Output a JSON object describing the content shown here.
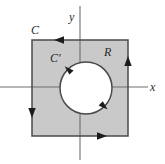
{
  "figure": {
    "width": 165,
    "height": 164,
    "background_color": "#ffffff"
  },
  "colors": {
    "region_fill": "#c9c9c9",
    "region_stroke": "#4a4a4a",
    "hole_fill": "#ffffff",
    "hole_stroke": "#4a4a4a",
    "axis_stroke": "#6e6e6e",
    "arrow_fill": "#1c1c1c",
    "label_color": "#2b2b2b"
  },
  "labels": {
    "outer_curve": "C",
    "inner_curve": "C′",
    "region": "R",
    "y_axis": "y",
    "x_axis": "x"
  },
  "chart_data": {
    "type": "diagram",
    "title": "",
    "xlabel": "x",
    "ylabel": "y",
    "grid": false,
    "legend_position": "none",
    "axes": {
      "x_axis_y_px": 87,
      "y_axis_x_px": 80,
      "x_axis_extent_px": [
        0,
        148
      ],
      "y_axis_extent_px": [
        6,
        160
      ]
    },
    "shapes": [
      {
        "name": "outer-boundary-square",
        "label": "C",
        "kind": "rectangle",
        "orientation": "counterclockwise",
        "fill": "#c9c9c9",
        "stroke": "#4a4a4a",
        "bounds_px": {
          "x": 32,
          "y": 40,
          "width": 96,
          "height": 96
        },
        "arrow_markers": [
          {
            "edge": "top",
            "direction": "left",
            "position_px": [
              61,
              40
            ]
          },
          {
            "edge": "left",
            "direction": "down",
            "position_px": [
              32,
              110
            ]
          },
          {
            "edge": "bottom",
            "direction": "right",
            "position_px": [
              99,
              136
            ]
          },
          {
            "edge": "right",
            "direction": "up",
            "position_px": [
              128,
              64
            ]
          }
        ]
      },
      {
        "name": "inner-boundary-circle",
        "label": "C′",
        "kind": "circle",
        "orientation": "clockwise",
        "fill": "#ffffff",
        "stroke": "#4a4a4a",
        "center_px": [
          86,
          88
        ],
        "radius_px": 26,
        "arrow_markers": [
          {
            "angle_deg": 135,
            "direction": "up-left",
            "position_px": [
              67.6,
              69.6
            ]
          },
          {
            "angle_deg": 315,
            "direction": "down-right",
            "position_px": [
              104.4,
              106.4
            ]
          }
        ]
      }
    ],
    "annotations": [
      {
        "text": "C",
        "position_px": [
          35,
          30
        ],
        "describes": "outer square boundary curve"
      },
      {
        "text": "C′",
        "position_px": [
          55,
          58
        ],
        "describes": "inner circular boundary curve"
      },
      {
        "text": "R",
        "position_px": [
          108,
          52
        ],
        "describes": "shaded annular region"
      },
      {
        "text": "y",
        "position_px": [
          72,
          17
        ],
        "describes": "vertical axis"
      },
      {
        "text": "x",
        "position_px": [
          152,
          87
        ],
        "describes": "horizontal axis"
      }
    ]
  }
}
